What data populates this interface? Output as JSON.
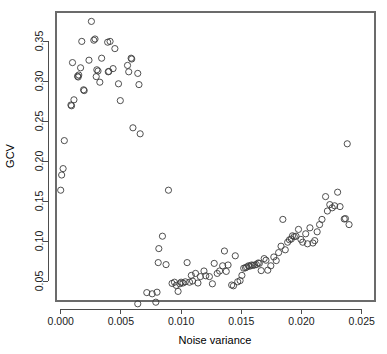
{
  "chart_data": {
    "type": "scatter",
    "title": "",
    "xlabel": "Noise variance",
    "ylabel": "GCV",
    "xlim": [
      -0.0007,
      0.0262
    ],
    "ylim": [
      0.012,
      0.385
    ],
    "grid": false,
    "legend": null,
    "xticks": [
      0.0,
      0.005,
      0.01,
      0.015,
      0.02,
      0.025
    ],
    "xticklabels": [
      "0.000",
      "0.005",
      "0.010",
      "0.015",
      "0.020",
      "0.025"
    ],
    "yticks": [
      0.05,
      0.1,
      0.15,
      0.2,
      0.25,
      0.3,
      0.35
    ],
    "yticklabels": [
      "0.05",
      "0.10",
      "0.15",
      "0.20",
      "0.25",
      "0.30",
      "0.35"
    ],
    "marker": "open-circle",
    "marker_size": 3.1,
    "marker_color": "#3c3c3c",
    "points": [
      {
        "x": 0.0,
        "y": 0.1635
      },
      {
        "x": 8e-05,
        "y": 0.1825
      },
      {
        "x": 0.0002,
        "y": 0.1905
      },
      {
        "x": 0.0003,
        "y": 0.2255
      },
      {
        "x": 0.00085,
        "y": 0.27
      },
      {
        "x": 0.0009,
        "y": 0.269
      },
      {
        "x": 0.00098,
        "y": 0.323
      },
      {
        "x": 0.0011,
        "y": 0.2765
      },
      {
        "x": 0.0014,
        "y": 0.306
      },
      {
        "x": 0.00145,
        "y": 0.305
      },
      {
        "x": 0.0015,
        "y": 0.3075
      },
      {
        "x": 0.00165,
        "y": 0.3165
      },
      {
        "x": 0.00175,
        "y": 0.3495
      },
      {
        "x": 0.0019,
        "y": 0.289
      },
      {
        "x": 0.00195,
        "y": 0.288
      },
      {
        "x": 0.00235,
        "y": 0.326
      },
      {
        "x": 0.00255,
        "y": 0.3745
      },
      {
        "x": 0.00275,
        "y": 0.351
      },
      {
        "x": 0.00285,
        "y": 0.3525
      },
      {
        "x": 0.00295,
        "y": 0.3055
      },
      {
        "x": 0.003,
        "y": 0.314
      },
      {
        "x": 0.0031,
        "y": 0.3125
      },
      {
        "x": 0.00325,
        "y": 0.2985
      },
      {
        "x": 0.0034,
        "y": 0.3285
      },
      {
        "x": 0.0039,
        "y": 0.3485
      },
      {
        "x": 0.00395,
        "y": 0.3115
      },
      {
        "x": 0.004,
        "y": 0.312
      },
      {
        "x": 0.0041,
        "y": 0.3495
      },
      {
        "x": 0.00435,
        "y": 0.3155
      },
      {
        "x": 0.0045,
        "y": 0.3405
      },
      {
        "x": 0.0048,
        "y": 0.2965
      },
      {
        "x": 0.00495,
        "y": 0.2755
      },
      {
        "x": 0.00555,
        "y": 0.3195
      },
      {
        "x": 0.00565,
        "y": 0.3115
      },
      {
        "x": 0.00585,
        "y": 0.3285
      },
      {
        "x": 0.0059,
        "y": 0.3275
      },
      {
        "x": 0.006,
        "y": 0.2415
      },
      {
        "x": 0.0064,
        "y": 0.3095
      },
      {
        "x": 0.0065,
        "y": 0.2955
      },
      {
        "x": 0.0066,
        "y": 0.234
      },
      {
        "x": 0.0064,
        "y": 0.0215
      },
      {
        "x": 0.00715,
        "y": 0.0355
      },
      {
        "x": 0.0076,
        "y": 0.034
      },
      {
        "x": 0.0079,
        "y": 0.0235
      },
      {
        "x": 0.008,
        "y": 0.036
      },
      {
        "x": 0.0081,
        "y": 0.073
      },
      {
        "x": 0.00815,
        "y": 0.0905
      },
      {
        "x": 0.00845,
        "y": 0.106
      },
      {
        "x": 0.00875,
        "y": 0.0705
      },
      {
        "x": 0.00895,
        "y": 0.1635
      },
      {
        "x": 0.00925,
        "y": 0.047
      },
      {
        "x": 0.00945,
        "y": 0.0485
      },
      {
        "x": 0.0096,
        "y": 0.0445
      },
      {
        "x": 0.00975,
        "y": 0.037
      },
      {
        "x": 0.0099,
        "y": 0.0465
      },
      {
        "x": 0.01,
        "y": 0.0485
      },
      {
        "x": 0.01015,
        "y": 0.0475
      },
      {
        "x": 0.01035,
        "y": 0.049
      },
      {
        "x": 0.0105,
        "y": 0.073
      },
      {
        "x": 0.0107,
        "y": 0.0485
      },
      {
        "x": 0.01085,
        "y": 0.057
      },
      {
        "x": 0.01095,
        "y": 0.05
      },
      {
        "x": 0.0112,
        "y": 0.0595
      },
      {
        "x": 0.0114,
        "y": 0.0475
      },
      {
        "x": 0.0116,
        "y": 0.0555
      },
      {
        "x": 0.0119,
        "y": 0.0625
      },
      {
        "x": 0.01205,
        "y": 0.0565
      },
      {
        "x": 0.01235,
        "y": 0.0555
      },
      {
        "x": 0.0126,
        "y": 0.0465
      },
      {
        "x": 0.01275,
        "y": 0.072
      },
      {
        "x": 0.013,
        "y": 0.0595
      },
      {
        "x": 0.0132,
        "y": 0.0625
      },
      {
        "x": 0.01345,
        "y": 0.069
      },
      {
        "x": 0.0136,
        "y": 0.0875
      },
      {
        "x": 0.01375,
        "y": 0.062
      },
      {
        "x": 0.0139,
        "y": 0.07
      },
      {
        "x": 0.0142,
        "y": 0.045
      },
      {
        "x": 0.01435,
        "y": 0.044
      },
      {
        "x": 0.0145,
        "y": 0.0815
      },
      {
        "x": 0.0147,
        "y": 0.049
      },
      {
        "x": 0.0149,
        "y": 0.0505
      },
      {
        "x": 0.01505,
        "y": 0.057
      },
      {
        "x": 0.0152,
        "y": 0.066
      },
      {
        "x": 0.01535,
        "y": 0.0665
      },
      {
        "x": 0.01545,
        "y": 0.0675
      },
      {
        "x": 0.0156,
        "y": 0.069
      },
      {
        "x": 0.0157,
        "y": 0.0685
      },
      {
        "x": 0.01585,
        "y": 0.07
      },
      {
        "x": 0.01595,
        "y": 0.0695
      },
      {
        "x": 0.0161,
        "y": 0.07
      },
      {
        "x": 0.01625,
        "y": 0.0705
      },
      {
        "x": 0.0164,
        "y": 0.0725
      },
      {
        "x": 0.0165,
        "y": 0.072
      },
      {
        "x": 0.01665,
        "y": 0.063
      },
      {
        "x": 0.0169,
        "y": 0.078
      },
      {
        "x": 0.01705,
        "y": 0.076
      },
      {
        "x": 0.0172,
        "y": 0.0635
      },
      {
        "x": 0.01745,
        "y": 0.069
      },
      {
        "x": 0.0177,
        "y": 0.08
      },
      {
        "x": 0.0179,
        "y": 0.0755
      },
      {
        "x": 0.0181,
        "y": 0.0855
      },
      {
        "x": 0.0183,
        "y": 0.0935
      },
      {
        "x": 0.01845,
        "y": 0.127
      },
      {
        "x": 0.01865,
        "y": 0.089
      },
      {
        "x": 0.01885,
        "y": 0.0985
      },
      {
        "x": 0.019,
        "y": 0.1015
      },
      {
        "x": 0.01915,
        "y": 0.1025
      },
      {
        "x": 0.01925,
        "y": 0.1065
      },
      {
        "x": 0.0194,
        "y": 0.1055
      },
      {
        "x": 0.01955,
        "y": 0.106
      },
      {
        "x": 0.01975,
        "y": 0.1145
      },
      {
        "x": 0.01995,
        "y": 0.102
      },
      {
        "x": 0.0201,
        "y": 0.0985
      },
      {
        "x": 0.02035,
        "y": 0.109
      },
      {
        "x": 0.0205,
        "y": 0.0965
      },
      {
        "x": 0.0207,
        "y": 0.1165
      },
      {
        "x": 0.02095,
        "y": 0.0975
      },
      {
        "x": 0.0211,
        "y": 0.1005
      },
      {
        "x": 0.0213,
        "y": 0.1115
      },
      {
        "x": 0.0215,
        "y": 0.1205
      },
      {
        "x": 0.0217,
        "y": 0.127
      },
      {
        "x": 0.022,
        "y": 0.1555
      },
      {
        "x": 0.02215,
        "y": 0.1375
      },
      {
        "x": 0.02235,
        "y": 0.1455
      },
      {
        "x": 0.02255,
        "y": 0.1415
      },
      {
        "x": 0.02275,
        "y": 0.144
      },
      {
        "x": 0.023,
        "y": 0.161
      },
      {
        "x": 0.0232,
        "y": 0.143
      },
      {
        "x": 0.02355,
        "y": 0.1275
      },
      {
        "x": 0.02365,
        "y": 0.128
      },
      {
        "x": 0.0238,
        "y": 0.2215
      },
      {
        "x": 0.02395,
        "y": 0.1205
      }
    ]
  },
  "plot": {
    "geometry": {
      "left": 56,
      "right": 375,
      "top": 12,
      "bottom": 301
    }
  }
}
